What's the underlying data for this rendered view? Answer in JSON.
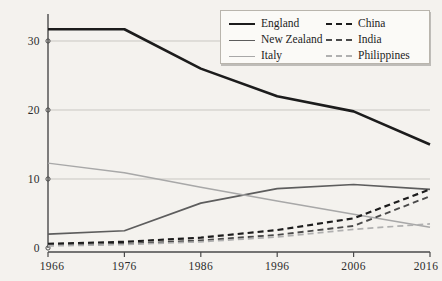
{
  "chart_data": {
    "type": "line",
    "title": "",
    "subtitle": "",
    "xlabel": "",
    "ylabel": "",
    "x": [
      1966,
      1976,
      1986,
      1996,
      2006,
      2016
    ],
    "xtick_labels": [
      "1966",
      "1976",
      "1986",
      "1996",
      "2006",
      "2016"
    ],
    "ytick_labels": [
      "0",
      "10",
      "20",
      "30"
    ],
    "yticks": [
      0,
      10,
      20,
      30
    ],
    "xlim": [
      1966,
      2016
    ],
    "ylim": [
      0,
      34
    ],
    "grid": "horizontal",
    "legend_position": "top-right",
    "series": [
      {
        "name": "England",
        "color": "#1c1c1c",
        "width": 2.6,
        "dash": "none",
        "values": [
          31.7,
          31.7,
          26.0,
          22.0,
          19.8,
          15.0
        ]
      },
      {
        "name": "New Zealand",
        "color": "#5d5d5d",
        "width": 1.7,
        "dash": "none",
        "values": [
          2.0,
          2.5,
          6.5,
          8.6,
          9.2,
          8.5
        ]
      },
      {
        "name": "Italy",
        "color": "#a8a8a8",
        "width": 1.5,
        "dash": "none",
        "values": [
          12.3,
          10.9,
          8.8,
          6.8,
          4.9,
          3.0
        ]
      },
      {
        "name": "China",
        "color": "#1c1c1c",
        "width": 2.2,
        "dash": "6,4",
        "values": [
          0.6,
          0.9,
          1.5,
          2.6,
          4.3,
          8.5
        ]
      },
      {
        "name": "India",
        "color": "#4a4a4a",
        "width": 1.9,
        "dash": "6,4",
        "values": [
          0.4,
          0.6,
          1.1,
          1.9,
          3.2,
          7.5
        ]
      },
      {
        "name": "Philippines",
        "color": "#b0b0b0",
        "width": 1.7,
        "dash": "6,4",
        "values": [
          0.3,
          0.5,
          0.9,
          1.6,
          2.7,
          3.5
        ]
      }
    ]
  },
  "legend": {
    "items": [
      {
        "label": "England"
      },
      {
        "label": "China"
      },
      {
        "label": "New Zealand"
      },
      {
        "label": "India"
      },
      {
        "label": "Italy"
      },
      {
        "label": "Philippines"
      }
    ]
  }
}
